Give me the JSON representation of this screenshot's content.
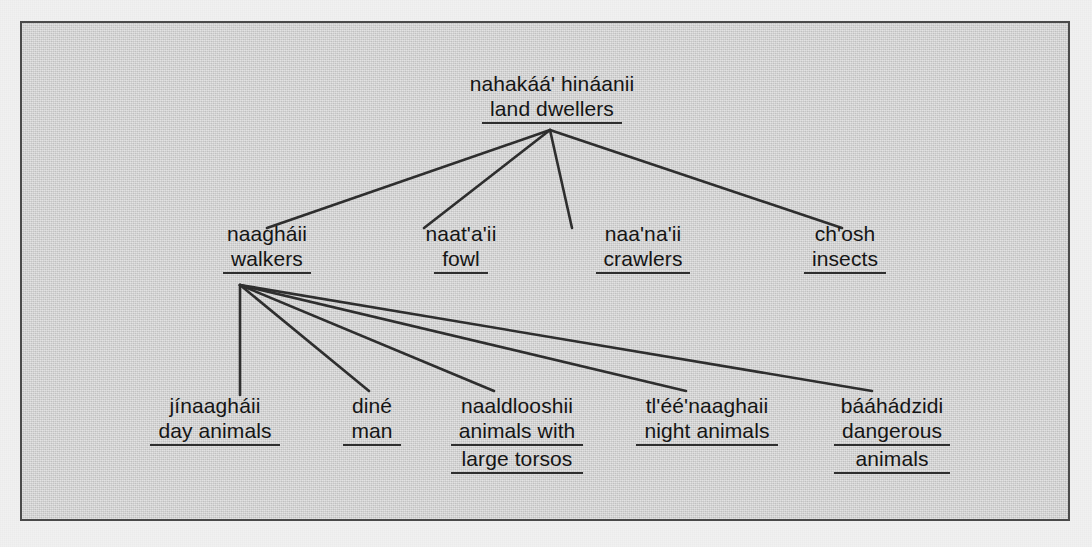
{
  "figure": {
    "kind": "taxonomy-tree-diagram",
    "panel_background_color": "#d3d3d3",
    "page_background_color": "#f1f1f1",
    "border_color": "#4a4a4a",
    "text_color": "#151515",
    "line_color": "#2e2e2e"
  },
  "tree": {
    "root": {
      "term": "nahakáá' hináanii",
      "gloss": "land dwellers"
    },
    "level2": [
      {
        "term": "naagháii",
        "gloss_lines": [
          "walkers"
        ]
      },
      {
        "term": "naat'a'ii",
        "gloss_lines": [
          "fowl"
        ]
      },
      {
        "term": "naa'na'ii",
        "gloss_lines": [
          "crawlers"
        ]
      },
      {
        "term": "ch'osh",
        "gloss_lines": [
          "insects"
        ]
      }
    ],
    "level3": [
      {
        "term": "jínaagháii",
        "gloss_lines": [
          "day animals"
        ]
      },
      {
        "term": "diné",
        "gloss_lines": [
          "man"
        ]
      },
      {
        "term": "naaldlooshii",
        "gloss_lines": [
          "animals with",
          "large torsos"
        ]
      },
      {
        "term": "tl'éé'naaghaii",
        "gloss_lines": [
          "night animals"
        ]
      },
      {
        "term": "bááhádzidi",
        "gloss_lines": [
          "dangerous",
          "animals"
        ]
      }
    ]
  },
  "connectors": {
    "from_root": [
      {
        "x1": 528,
        "y1": 107,
        "x2": 245,
        "y2": 205
      },
      {
        "x1": 528,
        "y1": 107,
        "x2": 402,
        "y2": 205
      },
      {
        "x1": 528,
        "y1": 107,
        "x2": 550,
        "y2": 205
      },
      {
        "x1": 528,
        "y1": 107,
        "x2": 820,
        "y2": 205
      }
    ],
    "from_walkers": [
      {
        "x1": 218,
        "y1": 262,
        "x2": 218,
        "y2": 370
      },
      {
        "x1": 218,
        "y1": 262,
        "x2": 345,
        "y2": 368
      },
      {
        "x1": 218,
        "y1": 262,
        "x2": 470,
        "y2": 368
      },
      {
        "x1": 218,
        "y1": 262,
        "x2": 662,
        "y2": 368
      },
      {
        "x1": 218,
        "y1": 262,
        "x2": 848,
        "y2": 368
      }
    ]
  }
}
